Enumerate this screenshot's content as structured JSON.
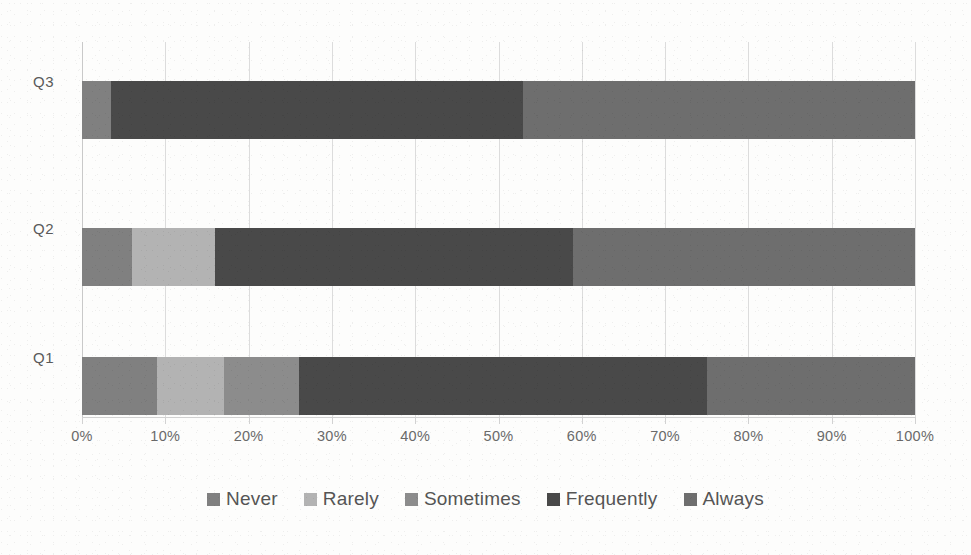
{
  "chart_data": {
    "type": "bar",
    "orientation": "horizontal",
    "stacked": true,
    "stack_mode": "percent",
    "title": "",
    "xlabel": "",
    "ylabel": "",
    "xlim": [
      0,
      100
    ],
    "xtick_labels": [
      "0%",
      "10%",
      "20%",
      "30%",
      "40%",
      "50%",
      "60%",
      "70%",
      "80%",
      "90%",
      "100%"
    ],
    "xtick_values": [
      0,
      10,
      20,
      30,
      40,
      50,
      60,
      70,
      80,
      90,
      100
    ],
    "grid": true,
    "grid_axis": "x",
    "legend_position": "bottom",
    "categories": [
      "Q1",
      "Q2",
      "Q3"
    ],
    "category_order_top_to_bottom": [
      "Q3",
      "Q2",
      "Q1"
    ],
    "series": [
      {
        "name": "Never",
        "color": "#808080",
        "values": [
          9,
          6,
          3.5
        ]
      },
      {
        "name": "Rarely",
        "color": "#b3b3b3",
        "values": [
          8,
          10,
          0
        ]
      },
      {
        "name": "Sometimes",
        "color": "#8c8c8c",
        "values": [
          9,
          0,
          0
        ]
      },
      {
        "name": "Frequently",
        "color": "#494949",
        "values": [
          49,
          43,
          49.5
        ]
      },
      {
        "name": "Always",
        "color": "#6e6e6e",
        "values": [
          25,
          41,
          47
        ]
      }
    ]
  },
  "axis": {
    "tick_labels": [
      "0%",
      "10%",
      "20%",
      "30%",
      "40%",
      "50%",
      "60%",
      "70%",
      "80%",
      "90%",
      "100%"
    ]
  },
  "categories": {
    "q3": "Q3",
    "q2": "Q2",
    "q1": "Q1"
  },
  "legend": {
    "items": [
      {
        "label": "Never",
        "color": "#808080"
      },
      {
        "label": "Rarely",
        "color": "#b3b3b3"
      },
      {
        "label": "Sometimes",
        "color": "#8c8c8c"
      },
      {
        "label": "Frequently",
        "color": "#494949"
      },
      {
        "label": "Always",
        "color": "#6e6e6e"
      }
    ]
  },
  "colors": {
    "gridline": "#dcdcdc",
    "axis": "#d2d2d2",
    "text": "#5a5a5a",
    "background": "#fdfdfc"
  }
}
